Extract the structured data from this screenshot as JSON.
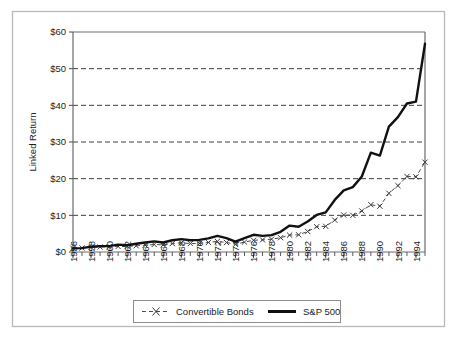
{
  "chart_data": {
    "type": "line",
    "title": "",
    "xlabel": "",
    "ylabel": "Linked Return",
    "ylim": [
      0,
      60
    ],
    "xlim": [
      1956,
      1995
    ],
    "grid": true,
    "y_ticks": [
      0,
      10,
      20,
      30,
      40,
      50,
      60
    ],
    "y_tick_labels": [
      "$0",
      "$10",
      "$20",
      "$30",
      "$40",
      "$50",
      "$60"
    ],
    "x_tick_labels": [
      "1956",
      "1958",
      "1960",
      "1962",
      "1964",
      "1966",
      "1968",
      "1970",
      "1972",
      "1974",
      "1976",
      "1978",
      "1980",
      "1982",
      "1984",
      "1986",
      "1988",
      "1990",
      "1992",
      "1994"
    ],
    "x": [
      1956,
      1957,
      1958,
      1959,
      1960,
      1961,
      1962,
      1963,
      1964,
      1965,
      1966,
      1967,
      1968,
      1969,
      1970,
      1971,
      1972,
      1973,
      1974,
      1975,
      1976,
      1977,
      1978,
      1979,
      1980,
      1981,
      1982,
      1983,
      1984,
      1985,
      1986,
      1987,
      1988,
      1989,
      1990,
      1991,
      1992,
      1993,
      1994,
      1995
    ],
    "legend_position": "bottom",
    "series": [
      {
        "name": "Convertible Bonds",
        "style": "dashed-with-x-markers",
        "marker": "x",
        "values": [
          1.0,
          1.1,
          1.25,
          1.35,
          1.4,
          1.5,
          1.5,
          1.7,
          1.85,
          2.05,
          1.95,
          2.3,
          2.5,
          2.3,
          2.3,
          2.6,
          2.9,
          2.6,
          2.1,
          2.7,
          3.2,
          3.3,
          3.5,
          3.9,
          4.6,
          4.7,
          5.6,
          6.9,
          7.0,
          8.7,
          10.1,
          10.0,
          11.2,
          12.9,
          12.5,
          16.0,
          18.1,
          20.6,
          20.5,
          24.5
        ]
      },
      {
        "name": "S&P 500",
        "style": "thick-solid",
        "marker": "none",
        "values": [
          1.0,
          1.05,
          1.45,
          1.6,
          1.6,
          2.0,
          1.85,
          2.25,
          2.6,
          2.9,
          2.6,
          3.2,
          3.5,
          3.2,
          3.3,
          3.7,
          4.4,
          3.8,
          2.8,
          3.8,
          4.7,
          4.4,
          4.6,
          5.5,
          7.2,
          6.9,
          8.3,
          10.1,
          10.8,
          14.2,
          16.8,
          17.7,
          20.6,
          27.1,
          26.3,
          34.2,
          36.8,
          40.5,
          41.0,
          56.8
        ]
      }
    ]
  },
  "legend": {
    "items": [
      {
        "label": "Convertible Bonds",
        "swatch": "dashed-x-marker"
      },
      {
        "label": "S&P 500",
        "swatch": "thick-solid-line"
      }
    ]
  },
  "colors": {
    "sp500": "#111111",
    "convertible": "#4b4b4b",
    "grid": "#3d3d3d",
    "axis": "#6a6a6a",
    "frame": "#b9b9b9",
    "background": "#ffffff"
  }
}
